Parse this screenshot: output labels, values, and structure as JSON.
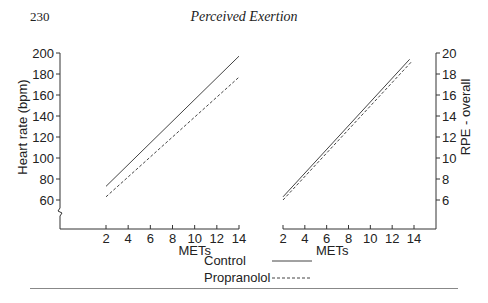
{
  "page": {
    "number": "230",
    "running_head": "Perceived Exertion"
  },
  "legend": {
    "items": [
      {
        "label": "Control",
        "style": "solid"
      },
      {
        "label": "Propranolol",
        "style": "dashed"
      }
    ]
  },
  "chart_data": [
    {
      "type": "line",
      "title": "",
      "xlabel": "METs",
      "ylabel": "Heart rate (bpm)",
      "x_ticks": [
        2,
        4,
        6,
        8,
        10,
        12,
        14
      ],
      "y_ticks": [
        60,
        80,
        100,
        120,
        140,
        160,
        180,
        200
      ],
      "xlim": [
        0,
        14
      ],
      "ylim": [
        50,
        200
      ],
      "axis_break": true,
      "grid": false,
      "series": [
        {
          "name": "Control",
          "style": "solid",
          "x": [
            2,
            14
          ],
          "y": [
            73,
            197
          ]
        },
        {
          "name": "Propranolol",
          "style": "dashed",
          "x": [
            2,
            14
          ],
          "y": [
            63,
            177
          ]
        }
      ]
    },
    {
      "type": "line",
      "title": "",
      "xlabel": "METs",
      "ylabel": "RPE - overall",
      "y_axis_position": "right",
      "x_ticks": [
        2,
        4,
        6,
        8,
        10,
        12,
        14
      ],
      "y_ticks": [
        6,
        8,
        10,
        12,
        14,
        16,
        18,
        20
      ],
      "xlim": [
        2,
        16
      ],
      "ylim": [
        4,
        20
      ],
      "grid": false,
      "series": [
        {
          "name": "Control",
          "style": "solid",
          "x": [
            2,
            13.6
          ],
          "y": [
            6.3,
            19.4
          ]
        },
        {
          "name": "Propranolol",
          "style": "dashed",
          "x": [
            2,
            13.8
          ],
          "y": [
            6.0,
            19.2
          ]
        }
      ]
    }
  ]
}
